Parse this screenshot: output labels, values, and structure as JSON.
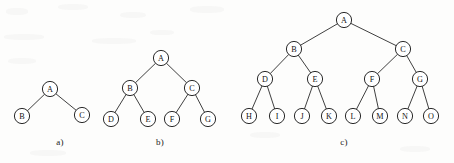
{
  "figure": {
    "background_color": "#fdfdfc",
    "ink_color": "#1f1f1f",
    "node_radius": 7.6,
    "caption_a": "a)",
    "caption_b": "b)",
    "caption_c": "c)"
  },
  "trees": [
    {
      "id": "tree-a",
      "caption": "a)",
      "caption_pos": {
        "x": 60,
        "y": 145
      },
      "nodes": [
        {
          "id": "a-A",
          "label": "A",
          "x": 50,
          "y": 89
        },
        {
          "id": "a-B",
          "label": "B",
          "x": 22,
          "y": 116
        },
        {
          "id": "a-C",
          "label": "C",
          "x": 82,
          "y": 115
        }
      ],
      "edges": [
        {
          "from": "a-A",
          "to": "a-B"
        },
        {
          "from": "a-A",
          "to": "a-C"
        }
      ]
    },
    {
      "id": "tree-b",
      "caption": "b)",
      "caption_pos": {
        "x": 160,
        "y": 145
      },
      "nodes": [
        {
          "id": "b-A",
          "label": "A",
          "x": 161,
          "y": 58
        },
        {
          "id": "b-B",
          "label": "B",
          "x": 130,
          "y": 88
        },
        {
          "id": "b-C",
          "label": "C",
          "x": 192,
          "y": 88
        },
        {
          "id": "b-D",
          "label": "D",
          "x": 111,
          "y": 119
        },
        {
          "id": "b-E",
          "label": "E",
          "x": 148,
          "y": 119
        },
        {
          "id": "b-F",
          "label": "F",
          "x": 172,
          "y": 119
        },
        {
          "id": "b-G",
          "label": "G",
          "x": 208,
          "y": 119
        }
      ],
      "edges": [
        {
          "from": "b-A",
          "to": "b-B"
        },
        {
          "from": "b-A",
          "to": "b-C"
        },
        {
          "from": "b-B",
          "to": "b-D"
        },
        {
          "from": "b-B",
          "to": "b-E"
        },
        {
          "from": "b-C",
          "to": "b-F"
        },
        {
          "from": "b-C",
          "to": "b-G"
        }
      ]
    },
    {
      "id": "tree-c",
      "caption": "c)",
      "caption_pos": {
        "x": 344,
        "y": 145
      },
      "nodes": [
        {
          "id": "c-A",
          "label": "A",
          "x": 344,
          "y": 20
        },
        {
          "id": "c-B",
          "label": "B",
          "x": 294,
          "y": 49
        },
        {
          "id": "c-C",
          "label": "C",
          "x": 403,
          "y": 49
        },
        {
          "id": "c-D",
          "label": "D",
          "x": 265,
          "y": 79
        },
        {
          "id": "c-E",
          "label": "E",
          "x": 315,
          "y": 79
        },
        {
          "id": "c-F",
          "label": "F",
          "x": 372,
          "y": 79
        },
        {
          "id": "c-G",
          "label": "G",
          "x": 420,
          "y": 79
        },
        {
          "id": "c-H",
          "label": "H",
          "x": 249,
          "y": 116
        },
        {
          "id": "c-I",
          "label": "I",
          "x": 277,
          "y": 116
        },
        {
          "id": "c-J",
          "label": "J",
          "x": 302,
          "y": 116
        },
        {
          "id": "c-K",
          "label": "K",
          "x": 329,
          "y": 116
        },
        {
          "id": "c-L",
          "label": "L",
          "x": 353,
          "y": 116
        },
        {
          "id": "c-M",
          "label": "M",
          "x": 380,
          "y": 116
        },
        {
          "id": "c-N",
          "label": "N",
          "x": 405,
          "y": 116
        },
        {
          "id": "c-O",
          "label": "O",
          "x": 431,
          "y": 116
        }
      ],
      "edges": [
        {
          "from": "c-A",
          "to": "c-B"
        },
        {
          "from": "c-A",
          "to": "c-C"
        },
        {
          "from": "c-B",
          "to": "c-D"
        },
        {
          "from": "c-B",
          "to": "c-E"
        },
        {
          "from": "c-C",
          "to": "c-F"
        },
        {
          "from": "c-C",
          "to": "c-G"
        },
        {
          "from": "c-D",
          "to": "c-H"
        },
        {
          "from": "c-D",
          "to": "c-I"
        },
        {
          "from": "c-E",
          "to": "c-J"
        },
        {
          "from": "c-E",
          "to": "c-K"
        },
        {
          "from": "c-F",
          "to": "c-L"
        },
        {
          "from": "c-F",
          "to": "c-M"
        },
        {
          "from": "c-G",
          "to": "c-N"
        },
        {
          "from": "c-G",
          "to": "c-O"
        }
      ]
    }
  ]
}
